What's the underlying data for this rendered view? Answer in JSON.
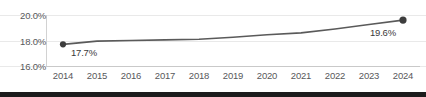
{
  "chart_data": {
    "type": "line",
    "title": "",
    "subtitle": "",
    "xlabel": "",
    "ylabel": "",
    "categories": [
      "2014",
      "2015",
      "2016",
      "2017",
      "2018",
      "2019",
      "2020",
      "2021",
      "2022",
      "2023",
      "2024"
    ],
    "series": [
      {
        "name": "share",
        "values": [
          17.7,
          17.95,
          18.0,
          18.05,
          18.1,
          18.25,
          18.45,
          18.6,
          18.9,
          19.25,
          19.6
        ]
      }
    ],
    "ylim": [
      16.0,
      20.0
    ],
    "yticks": [
      16.0,
      18.0,
      20.0
    ],
    "ytick_labels": [
      "16.0%",
      "18.0%",
      "20.0%"
    ],
    "xtick_labels": [
      "2014",
      "2015",
      "2016",
      "2017",
      "2018",
      "2019",
      "2020",
      "2021",
      "2022",
      "2023",
      "2024"
    ],
    "grid": true,
    "legend": false,
    "legend_position": "none",
    "point_labels": [
      {
        "category": "2014",
        "value": 17.7,
        "text": "17.7%"
      },
      {
        "category": "2024",
        "value": 19.6,
        "text": "19.6%"
      }
    ],
    "markers": [
      {
        "category": "2014",
        "value": 17.7
      },
      {
        "category": "2024",
        "value": 19.6
      }
    ],
    "colors": {
      "line": "#5a5a5a",
      "marker": "#3d3d3d",
      "grid": "#e9e9e9",
      "axis": "#c9c9c9",
      "tick_text": "#58595b",
      "label_text": "#3a3a3a",
      "background": "#ffffff",
      "bottom_strip": "#1c1c1c"
    }
  }
}
